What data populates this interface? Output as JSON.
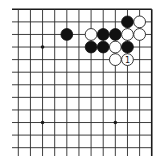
{
  "diagram": {
    "type": "go-board-fragment",
    "corner": "top-right",
    "grid": {
      "columns": 12,
      "rows": 12,
      "x0": 18.3,
      "y0": 9.3,
      "dx": 12.13,
      "dy": 12.58,
      "left_extend_to": 12,
      "bottom_extend_to": 156,
      "right_edge_col": 11,
      "top_edge_row": 0
    },
    "colors": {
      "line": "#2a2a2a",
      "black_stone": "#111111",
      "white_stone": "#ffffff",
      "background": "#ffffff"
    },
    "star_points": [
      {
        "col": 2,
        "row": 3
      },
      {
        "col": 2,
        "row": 9
      },
      {
        "col": 8,
        "row": 9
      }
    ],
    "stones": [
      {
        "color": "black",
        "col": 9,
        "row": 1,
        "label": ""
      },
      {
        "color": "white",
        "col": 10,
        "row": 1,
        "label": ""
      },
      {
        "color": "black",
        "col": 4,
        "row": 2,
        "label": ""
      },
      {
        "color": "white",
        "col": 6,
        "row": 2,
        "label": ""
      },
      {
        "color": "black",
        "col": 7,
        "row": 2,
        "label": ""
      },
      {
        "color": "black",
        "col": 8,
        "row": 2,
        "label": ""
      },
      {
        "color": "white",
        "col": 9,
        "row": 2,
        "label": ""
      },
      {
        "color": "white",
        "col": 10,
        "row": 2,
        "label": ""
      },
      {
        "color": "black",
        "col": 6,
        "row": 3,
        "label": ""
      },
      {
        "color": "black",
        "col": 7,
        "row": 3,
        "label": ""
      },
      {
        "color": "white",
        "col": 8,
        "row": 3,
        "label": ""
      },
      {
        "color": "black",
        "col": 9,
        "row": 3,
        "label": ""
      },
      {
        "color": "white",
        "col": 8,
        "row": 4,
        "label": ""
      },
      {
        "color": "white",
        "col": 9,
        "row": 4,
        "label": "1"
      }
    ]
  }
}
